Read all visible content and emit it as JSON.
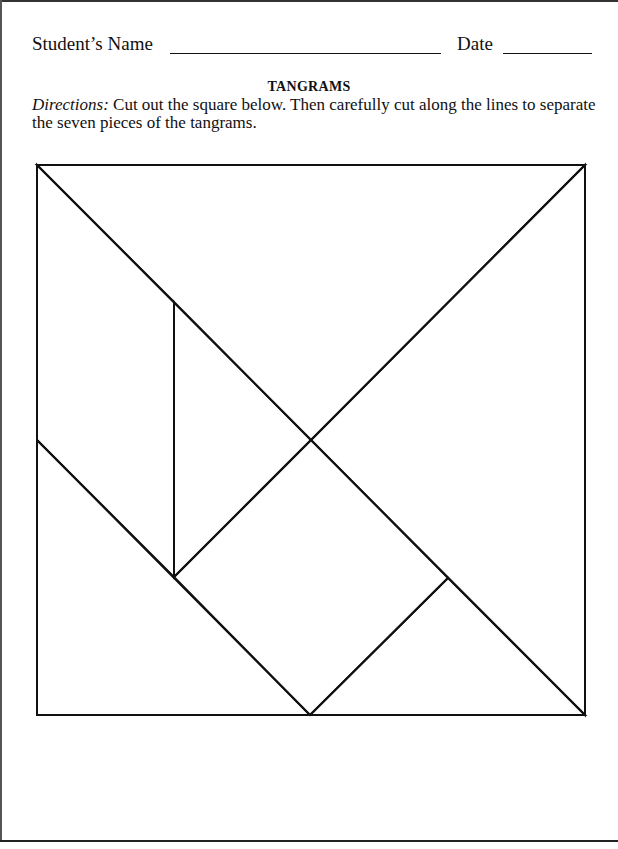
{
  "header": {
    "name_label": "Student’s Name",
    "name_value": "",
    "date_label": "Date",
    "date_value": ""
  },
  "worksheet": {
    "title": "TANGRAMS",
    "directions_lead": "Directions:",
    "directions_text": " Cut out the square below. Then carefully cut along the lines to separate the seven pieces of the tangrams."
  },
  "tangram": {
    "piece_count": 7,
    "square": {
      "x": 37,
      "y": 165,
      "width": 548,
      "height": 550
    },
    "stroke_color": "#111111",
    "pieces": [
      {
        "name": "large-triangle-top",
        "points": "37,165 585,165 311,440"
      },
      {
        "name": "large-triangle-right",
        "points": "585,165 585,715 311,440"
      },
      {
        "name": "parallelogram-left",
        "points": "37,165 174,302 174,577 37,440"
      },
      {
        "name": "small-triangle-center",
        "points": "174,302 311,440 174,577"
      },
      {
        "name": "square-center",
        "points": "311,440 448,578 310,715 174,577"
      },
      {
        "name": "small-triangle-bottom",
        "points": "448,578 585,715 310,715"
      },
      {
        "name": "medium-triangle-bottom-left",
        "points": "37,440 310,715 37,715"
      }
    ]
  }
}
